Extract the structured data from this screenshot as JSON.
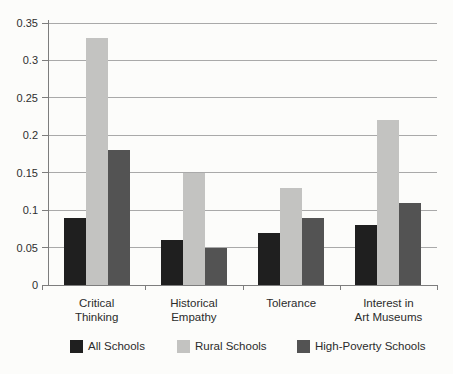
{
  "chart_data": {
    "type": "bar",
    "title": "",
    "categories": [
      "Critical Thinking",
      "Historical Empathy",
      "Tolerance",
      "Interest in Art Museums"
    ],
    "category_label_lines": [
      [
        "Critical",
        "Thinking"
      ],
      [
        "Historical",
        "Empathy"
      ],
      [
        "Tolerance"
      ],
      [
        "Interest in",
        "Art Museums"
      ]
    ],
    "series": [
      {
        "name": "All Schools",
        "color": "#1f1f1f",
        "values": [
          0.09,
          0.06,
          0.07,
          0.08
        ]
      },
      {
        "name": "Rural Schools",
        "color": "#c3c3c1",
        "values": [
          0.33,
          0.15,
          0.13,
          0.22
        ]
      },
      {
        "name": "High-Poverty Schools",
        "color": "#535353",
        "values": [
          0.18,
          0.05,
          0.09,
          0.11
        ]
      }
    ],
    "xlabel": "",
    "ylabel": "",
    "ylim": [
      0,
      0.35
    ],
    "ytick_step": 0.05,
    "ytick_labels": [
      "0",
      "0.05",
      "0.1",
      "0.15",
      "0.2",
      "0.25",
      "0.3",
      "0.35"
    ],
    "grid": true,
    "legend_position": "bottom"
  },
  "colors": {
    "background": "#fcfcfa",
    "gridline": "#a9a9a9",
    "axis": "#7d7d7d",
    "text": "#2b2b2b"
  }
}
